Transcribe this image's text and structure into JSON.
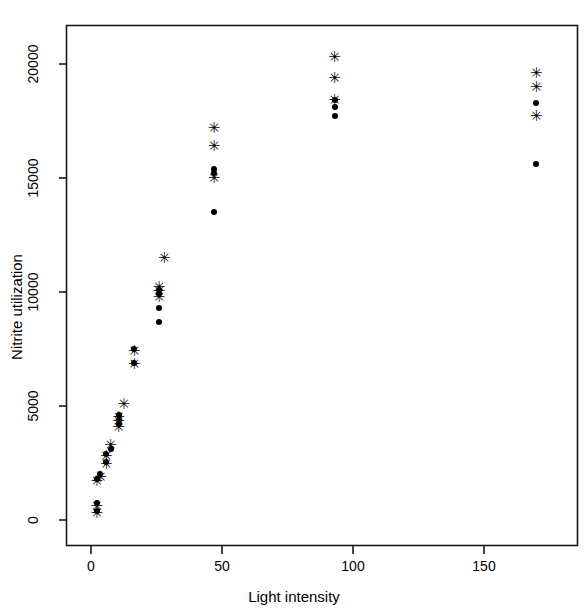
{
  "chart_data": {
    "type": "scatter",
    "title": "",
    "xlabel": "Light intensity",
    "ylabel": "Nitrite utilization",
    "xlim": [
      -5,
      180
    ],
    "ylim": [
      -1200,
      21800
    ],
    "xticks": [
      0,
      50,
      100,
      150
    ],
    "xtick_labels": [
      "0",
      "50",
      "100",
      "150"
    ],
    "yticks": [
      0,
      5000,
      10000,
      15000,
      20000
    ],
    "ytick_labels": [
      "0",
      "5000",
      "10000",
      "15000",
      "20000"
    ],
    "grid": false,
    "legend": "none",
    "frame": "box",
    "series": [
      {
        "name": "series-dot",
        "marker": "dot",
        "points": [
          {
            "x": 2.2,
            "y": 400
          },
          {
            "x": 2.2,
            "y": 750
          },
          {
            "x": 2.2,
            "y": 1800
          },
          {
            "x": 3.6,
            "y": 2000
          },
          {
            "x": 5.8,
            "y": 2550
          },
          {
            "x": 5.8,
            "y": 2900
          },
          {
            "x": 7.5,
            "y": 3100
          },
          {
            "x": 10.5,
            "y": 4200
          },
          {
            "x": 10.5,
            "y": 4400
          },
          {
            "x": 10.5,
            "y": 4600
          },
          {
            "x": 16.5,
            "y": 6900
          },
          {
            "x": 16.5,
            "y": 7500
          },
          {
            "x": 26.0,
            "y": 8700
          },
          {
            "x": 26.0,
            "y": 9300
          },
          {
            "x": 26.0,
            "y": 9900
          },
          {
            "x": 26.0,
            "y": 10100
          },
          {
            "x": 47.0,
            "y": 13500
          },
          {
            "x": 47.0,
            "y": 15200
          },
          {
            "x": 47.0,
            "y": 15400
          },
          {
            "x": 93.0,
            "y": 17700
          },
          {
            "x": 93.0,
            "y": 18100
          },
          {
            "x": 93.0,
            "y": 18400
          },
          {
            "x": 170.0,
            "y": 15600
          },
          {
            "x": 170.0,
            "y": 18300
          }
        ]
      },
      {
        "name": "series-star",
        "marker": "star",
        "glyph": "✳",
        "points": [
          {
            "x": 2.2,
            "y": 300
          },
          {
            "x": 2.2,
            "y": 600
          },
          {
            "x": 2.2,
            "y": 1700
          },
          {
            "x": 3.6,
            "y": 1900
          },
          {
            "x": 5.8,
            "y": 2450
          },
          {
            "x": 5.8,
            "y": 2800
          },
          {
            "x": 7.5,
            "y": 3300
          },
          {
            "x": 10.5,
            "y": 4100
          },
          {
            "x": 10.5,
            "y": 4350
          },
          {
            "x": 10.5,
            "y": 4500
          },
          {
            "x": 12.5,
            "y": 5100
          },
          {
            "x": 16.5,
            "y": 6850
          },
          {
            "x": 16.5,
            "y": 7400
          },
          {
            "x": 26.0,
            "y": 9800
          },
          {
            "x": 26.0,
            "y": 10050
          },
          {
            "x": 26.0,
            "y": 10200
          },
          {
            "x": 28.0,
            "y": 11500
          },
          {
            "x": 47.0,
            "y": 15000
          },
          {
            "x": 47.0,
            "y": 16400
          },
          {
            "x": 47.0,
            "y": 17200
          },
          {
            "x": 93.0,
            "y": 18400
          },
          {
            "x": 93.0,
            "y": 19400
          },
          {
            "x": 93.0,
            "y": 20300
          },
          {
            "x": 170.0,
            "y": 17700
          },
          {
            "x": 170.0,
            "y": 19000
          },
          {
            "x": 170.0,
            "y": 19600
          }
        ]
      }
    ]
  },
  "axes": {
    "frame_color": "#1a1a1a",
    "tick_color": "#1a1a1a",
    "background": "#ffffff"
  }
}
